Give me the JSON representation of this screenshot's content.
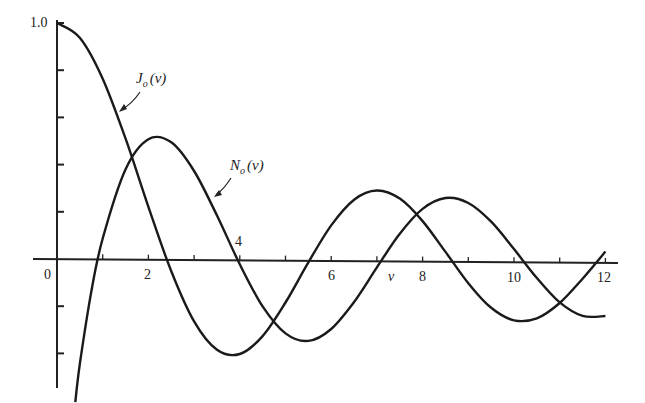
{
  "chart_data": {
    "type": "line",
    "title": "",
    "xlabel": "v",
    "ylabel": "",
    "xlim": [
      0,
      12.3
    ],
    "ylim": [
      -0.55,
      1.0
    ],
    "grid": false,
    "x_tick_labels": [
      "0",
      "2",
      "4",
      "6",
      "8",
      "10",
      "12"
    ],
    "x_ticks": [
      0,
      1,
      2,
      3,
      4,
      5,
      6,
      7,
      8,
      9,
      10,
      11,
      12
    ],
    "y_tick_labels": [
      "1.0"
    ],
    "y_ticks": [
      1.0,
      0.8,
      0.6,
      0.4,
      0.2,
      0,
      -0.2,
      -0.4
    ],
    "annotations": [
      "J_o(v)",
      "N_o(v)"
    ],
    "series": [
      {
        "name": "J_o(v)",
        "x": [
          0,
          0.5,
          1,
          1.5,
          2,
          2.5,
          3,
          3.5,
          4,
          4.5,
          5,
          5.5,
          6,
          6.5,
          7,
          7.5,
          8,
          8.5,
          9,
          9.5,
          10,
          10.5,
          11,
          11.5,
          12
        ],
        "values": [
          1.0,
          0.9385,
          0.7652,
          0.5118,
          0.2239,
          -0.0484,
          -0.2601,
          -0.3801,
          -0.3971,
          -0.3205,
          -0.1776,
          -0.0068,
          0.1506,
          0.2601,
          0.3001,
          0.2663,
          0.1717,
          0.0419,
          -0.0903,
          -0.1939,
          -0.2459,
          -0.2366,
          -0.1712,
          -0.0677,
          0.0477
        ]
      },
      {
        "name": "N_o(v)",
        "x": [
          0.4,
          0.5,
          0.75,
          1,
          1.5,
          2,
          2.5,
          3,
          3.5,
          4,
          4.5,
          5,
          5.5,
          6,
          6.5,
          7,
          7.5,
          8,
          8.5,
          9,
          9.5,
          10,
          10.5,
          11,
          11.5,
          12
        ],
        "values": [
          -0.606,
          -0.4445,
          -0.1372,
          0.0883,
          0.3824,
          0.5104,
          0.4981,
          0.3769,
          0.189,
          -0.0169,
          -0.1947,
          -0.3085,
          -0.3395,
          -0.2882,
          -0.1732,
          -0.026,
          0.1173,
          0.2235,
          0.2702,
          0.2499,
          0.1712,
          0.0557,
          -0.066,
          -0.1688,
          -0.2252,
          -0.2252
        ]
      }
    ]
  },
  "labels": {
    "y_top": "1.0",
    "origin": "0",
    "x2": "2",
    "x4": "4",
    "x6": "6",
    "x8": "8",
    "x10": "10",
    "x12": "12",
    "axis_var": "v",
    "j_main": "J",
    "j_sub": "o",
    "j_arg": "(v)",
    "n_main": "N",
    "n_sub": "o",
    "n_arg": "(v)"
  }
}
